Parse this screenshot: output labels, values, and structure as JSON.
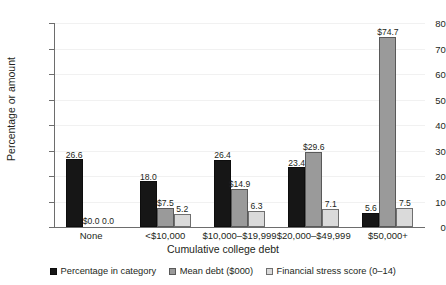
{
  "chart_data": {
    "type": "bar",
    "title": "",
    "xlabel": "Cumulative college debt",
    "ylabel": "Percentage or amount",
    "ylim": [
      0,
      80
    ],
    "ytick_step": 10,
    "yticks": [
      "0",
      "10",
      "20",
      "30",
      "40",
      "50",
      "60",
      "70",
      "80"
    ],
    "grid": true,
    "grid_axis": "y",
    "legend_position": "bottom",
    "categories": [
      "None",
      "<$10,000",
      "$10,000–$19,999",
      "$20,000–$49,999",
      "$50,000+"
    ],
    "series": [
      {
        "name": "Percentage in category",
        "color": "#161616",
        "values": [
          26.6,
          18.0,
          26.4,
          23.4,
          5.6
        ],
        "labels": [
          "26.6",
          "18.0",
          "26.4",
          "23.4",
          "5.6"
        ]
      },
      {
        "name": "Mean debt ($000)",
        "color": "#9a9a9a",
        "values": [
          0.0,
          7.5,
          14.9,
          29.6,
          74.7
        ],
        "labels": [
          "$0.0",
          "$7.5",
          "$14.9",
          "$29.6",
          "$74.7"
        ]
      },
      {
        "name": "Financial stress score (0–14)",
        "color": "#dadada",
        "values": [
          0.0,
          5.2,
          6.3,
          7.1,
          7.5
        ],
        "labels": [
          "0.0",
          "5.2",
          "6.3",
          "7.1",
          "7.5"
        ]
      }
    ]
  }
}
